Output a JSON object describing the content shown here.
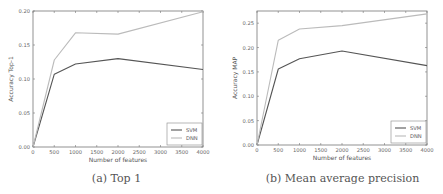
{
  "chart_data": [
    {
      "type": "line",
      "title": "",
      "caption": "(a) Top 1",
      "xlabel": "Number of features",
      "ylabel": "Accuracy Top-1",
      "x": [
        0,
        500,
        1000,
        2000,
        4000
      ],
      "series": [
        {
          "name": "SVM",
          "color": "#555555",
          "values": [
            0.0,
            0.107,
            0.122,
            0.13,
            0.114
          ]
        },
        {
          "name": "DNN",
          "color": "#bbbbbb",
          "values": [
            0.0,
            0.128,
            0.168,
            0.166,
            0.199
          ]
        }
      ],
      "xlim": [
        0,
        4000
      ],
      "ylim": [
        0,
        0.2
      ],
      "xticks": [
        "0",
        "500",
        "1000",
        "1500",
        "2000",
        "2500",
        "3000",
        "3500",
        "4000"
      ],
      "yticks": [
        "0.00",
        "0.05",
        "0.10",
        "0.15",
        "0.20"
      ],
      "grid": false,
      "legend_position": "lower right"
    },
    {
      "type": "line",
      "title": "",
      "caption": "(b) Mean average precision",
      "xlabel": "Number of features",
      "ylabel": "Accuracy MAP",
      "x": [
        0,
        500,
        1000,
        2000,
        4000
      ],
      "series": [
        {
          "name": "SVM",
          "color": "#555555",
          "values": [
            0.0,
            0.156,
            0.177,
            0.193,
            0.163
          ]
        },
        {
          "name": "DNN",
          "color": "#bbbbbb",
          "values": [
            0.0,
            0.215,
            0.238,
            0.245,
            0.269
          ]
        }
      ],
      "xlim": [
        0,
        4000
      ],
      "ylim": [
        0,
        0.275
      ],
      "xticks": [
        "0",
        "500",
        "1000",
        "1500",
        "2000",
        "2500",
        "3000",
        "3500",
        "4000"
      ],
      "yticks": [
        "0.00",
        "0.05",
        "0.10",
        "0.15",
        "0.20",
        "0.25"
      ],
      "grid": false,
      "legend_position": "lower right"
    }
  ]
}
